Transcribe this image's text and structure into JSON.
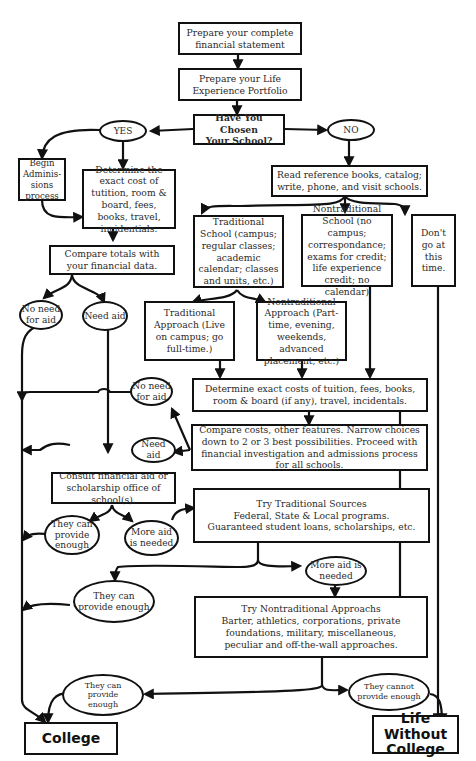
{
  "flowchart": {
    "nodes": {
      "financial_statement": "Prepare your complete financial statement",
      "portfolio": "Prepare your Life Experience Portfolio",
      "chosen_school": "Have You Chosen Your School?",
      "yes": "YES",
      "no": "NO",
      "begin_admissions": "Begin Adminis-sions process",
      "determine_exact_cost": "Determine the exact cost of tutition, room & board, fees, books, travel, incidentials.",
      "compare_totals": "Compare totals with your financial data.",
      "no_need_aid_1": "No need for aid",
      "need_aid_1": "Need aid",
      "read_reference": "Read reference books, catalog; write, phone, and visit schools.",
      "traditional_school": "Traditional School (campus; regular classes; academic calendar; classes and units, etc.)",
      "nontraditional_school": "Nontraditional School (no campus; correspondance; exams for credit; life experience credit; no calendar)",
      "dont_go": "Don't go at this time.",
      "traditional_approach": "Traditional Approach (Live on campus; go full-time.)",
      "nontraditional_approach": "Nontraditional Approach (Part-time, evening, weekends, advanced placement, etc.)",
      "determine_exact_costs_2": "Determine exact costs of tuition, fees, books, room & board (if any), travel, incidentals.",
      "no_need_aid_2": "No need for aid",
      "need_aid_2": "Need aid",
      "compare_costs": "Compare costs, other features. Narrow choices down to 2 or 3 best possibilities. Proceed with financial investigation and admissions process for all schools.",
      "consult_office": "Consult financial aid or scholarship office of school(s).",
      "can_provide_1": "They can provide enough",
      "more_aid_1": "More aid is needed",
      "traditional_sources": "Try Traditional Sources Federal, State & Local programs. Guaranteed student loans, scholarships, etc.",
      "more_aid_2": "More aid is needed",
      "can_provide_2": "They can provide enough",
      "nontraditional_approaches": "Try Nontraditional Approachs Barter, athletics, corporations, private foundations, military, miscellaneous, peculiar and off-the-wall approaches.",
      "can_provide_3": "They can provide enough",
      "cannot_provide": "They cannot provide enough",
      "college": "College",
      "life_without_college": "Life Without College"
    },
    "lines": {
      "ts1": "Try Traditional Sources",
      "ts2": "Federal, State & Local programs.",
      "ts3": "Guaranteed student loans, scholarships, etc.",
      "na1": "Try Nontraditional Approachs",
      "na2": "Barter, athletics, corporations, private foundations, military, miscellaneous, peculiar and off-the-wall approaches.",
      "hc1": "Have You  Chosen",
      "hc2": "Your School?",
      "lw1": "Life Without",
      "lw2": "College"
    }
  }
}
